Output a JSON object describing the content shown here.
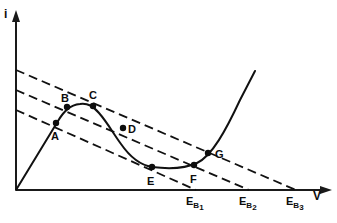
{
  "figure": {
    "kind": "iv-characteristic-with-load-lines",
    "background_color": "#ffffff",
    "ink_color": "#111111"
  },
  "axes": {
    "y_axis": {
      "label": "i",
      "name": "current-axis"
    },
    "x_axis": {
      "label": "V",
      "name": "voltage-axis"
    },
    "origin_px": [
      16,
      190
    ],
    "x_axis_end_px": [
      331,
      190
    ],
    "y_axis_top_px": [
      16,
      12
    ]
  },
  "ticks": {
    "x": [
      {
        "label_main": "E",
        "label_sub": "B",
        "label_sub2": "1",
        "x_px": 196
      },
      {
        "label_main": "E",
        "label_sub": "B",
        "label_sub2": "2",
        "x_px": 249
      },
      {
        "label_main": "E",
        "label_sub": "B",
        "label_sub2": "3",
        "x_px": 296
      }
    ]
  },
  "load_lines": [
    {
      "name": "load-line-1",
      "y_intercept_px": 110,
      "x_intercept_px": 196,
      "style": "dashed"
    },
    {
      "name": "load-line-2",
      "y_intercept_px": 90,
      "x_intercept_px": 249,
      "style": "dashed"
    },
    {
      "name": "load-line-3",
      "y_intercept_px": 70,
      "x_intercept_px": 296,
      "style": "dashed"
    }
  ],
  "curve": {
    "name": "s-shaped-iv-curve",
    "description": "N-shaped current-voltage characteristic rising from origin, peaking, falling to a valley, then rising steeply",
    "path": "M 16 190 L 58 121 C 64 111 70 105 80 104 C 88 103 93 106 99 113 C 107 122 113 133 121 144 C 130 157 140 165 152 167 C 168 169 184 169 197 163 C 212 156 226 130 240 100 L 255 71"
  },
  "points": [
    {
      "label": "A",
      "x_px": 56,
      "y_px": 123,
      "label_dx": -1,
      "label_dy": 15
    },
    {
      "label": "B",
      "x_px": 67,
      "y_px": 107,
      "label_dx": -1,
      "label_dy": -6
    },
    {
      "label": "C",
      "x_px": 93,
      "y_px": 106,
      "label_dx": 0,
      "label_dy": -8
    },
    {
      "label": "D",
      "x_px": 123,
      "y_px": 128,
      "label_dx": 6,
      "label_dy": 3
    },
    {
      "label": "E",
      "x_px": 152,
      "y_px": 167,
      "label_dx": -2,
      "label_dy": 16
    },
    {
      "label": "F",
      "x_px": 194,
      "y_px": 165,
      "label_dx": -1,
      "label_dy": 16
    },
    {
      "label": "G",
      "x_px": 208,
      "y_px": 153,
      "label_dx": 8,
      "label_dy": 3
    }
  ]
}
